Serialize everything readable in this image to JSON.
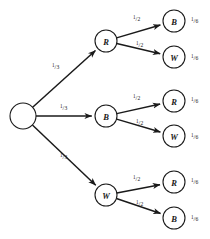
{
  "diagram": {
    "type": "tree",
    "stroke_color": "#1a1a1a",
    "background_color": "#ffffff",
    "root": {
      "label": "",
      "name": "root-node",
      "cx": 23,
      "cy": 116,
      "r": 13
    },
    "level1": [
      {
        "label": "R",
        "name": "node-level1-r",
        "cx": 106,
        "cy": 41,
        "r": 11,
        "edge_label": {
          "num": "1",
          "bar": "/",
          "den": "3"
        },
        "edge_label_x": 52,
        "edge_label_y": 66
      },
      {
        "label": "B",
        "name": "node-level1-b",
        "cx": 106,
        "cy": 116,
        "r": 11,
        "edge_label": {
          "num": "1",
          "bar": "/",
          "den": "3"
        },
        "edge_label_x": 60,
        "edge_label_y": 107
      },
      {
        "label": "W",
        "name": "node-level1-w",
        "cx": 106,
        "cy": 195,
        "r": 11,
        "edge_label": {
          "num": "1",
          "bar": "/",
          "den": "3"
        },
        "edge_label_x": 60,
        "edge_label_y": 156
      }
    ],
    "level2": [
      {
        "label": "B",
        "name": "node-leaf-b-1",
        "cx": 174,
        "cy": 21,
        "r": 11,
        "parent": 0,
        "edge_label": {
          "num": "1",
          "bar": "/",
          "den": "2"
        },
        "edge_label_x": 133,
        "edge_label_y": 18,
        "outcome": {
          "num": "1",
          "bar": "/",
          "den": "6"
        },
        "outcome_x": 191,
        "outcome_y": 20
      },
      {
        "label": "W",
        "name": "node-leaf-w-1",
        "cx": 174,
        "cy": 57,
        "r": 11,
        "parent": 0,
        "edge_label": {
          "num": "1",
          "bar": "/",
          "den": "2"
        },
        "edge_label_x": 136,
        "edge_label_y": 44,
        "outcome": {
          "num": "1",
          "bar": "/",
          "den": "6"
        },
        "outcome_x": 191,
        "outcome_y": 57
      },
      {
        "label": "R",
        "name": "node-leaf-r-2",
        "cx": 174,
        "cy": 101,
        "r": 11,
        "parent": 1,
        "edge_label": {
          "num": "1",
          "bar": "/",
          "den": "2"
        },
        "edge_label_x": 133,
        "edge_label_y": 97,
        "outcome": {
          "num": "1",
          "bar": "/",
          "den": "6"
        },
        "outcome_x": 191,
        "outcome_y": 100
      },
      {
        "label": "W",
        "name": "node-leaf-w-2",
        "cx": 174,
        "cy": 136,
        "r": 11,
        "parent": 1,
        "edge_label": {
          "num": "1",
          "bar": "/",
          "den": "2"
        },
        "edge_label_x": 136,
        "edge_label_y": 122,
        "outcome": {
          "num": "1",
          "bar": "/",
          "den": "6"
        },
        "outcome_x": 191,
        "outcome_y": 136
      },
      {
        "label": "R",
        "name": "node-leaf-r-3",
        "cx": 174,
        "cy": 182,
        "r": 11,
        "parent": 2,
        "edge_label": {
          "num": "1",
          "bar": "/",
          "den": "2"
        },
        "edge_label_x": 133,
        "edge_label_y": 178,
        "outcome": {
          "num": "1",
          "bar": "/",
          "den": "6"
        },
        "outcome_x": 191,
        "outcome_y": 181
      },
      {
        "label": "B",
        "name": "node-leaf-b-3",
        "cx": 174,
        "cy": 218,
        "r": 11,
        "parent": 2,
        "edge_label": {
          "num": "1",
          "bar": "/",
          "den": "2"
        },
        "edge_label_x": 136,
        "edge_label_y": 203,
        "outcome": {
          "num": "1",
          "bar": "/",
          "den": "6"
        },
        "outcome_x": 191,
        "outcome_y": 218
      }
    ]
  }
}
